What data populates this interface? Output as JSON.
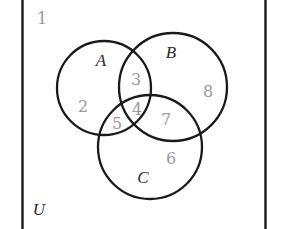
{
  "diagram": {
    "type": "venn-3-set",
    "universe": {
      "label": "U",
      "outside_region": "1"
    },
    "sets": [
      {
        "label": "A",
        "cx": 104,
        "cy": 88,
        "r": 47
      },
      {
        "label": "B",
        "cx": 173,
        "cy": 87,
        "r": 54
      },
      {
        "label": "C",
        "cx": 150,
        "cy": 147,
        "r": 52
      }
    ],
    "regions": [
      {
        "id": "1",
        "label": "1",
        "membership": "outside all sets",
        "x": 42,
        "y": 24
      },
      {
        "id": "2",
        "label": "2",
        "membership": "A only",
        "x": 83,
        "y": 112
      },
      {
        "id": "3",
        "label": "3",
        "membership": "A and B only",
        "x": 136,
        "y": 85
      },
      {
        "id": "4",
        "label": "4",
        "membership": "A and B and C",
        "x": 137,
        "y": 115
      },
      {
        "id": "5",
        "label": "5",
        "membership": "A and C only",
        "x": 117,
        "y": 129
      },
      {
        "id": "6",
        "label": "6",
        "membership": "C only",
        "x": 171,
        "y": 164
      },
      {
        "id": "7",
        "label": "7",
        "membership": "B and C only",
        "x": 166,
        "y": 125
      },
      {
        "id": "8",
        "label": "8",
        "membership": "B only",
        "x": 208,
        "y": 97
      }
    ],
    "set_label_positions": {
      "A": {
        "x": 101,
        "y": 66
      },
      "B": {
        "x": 171,
        "y": 58
      },
      "C": {
        "x": 143,
        "y": 183
      },
      "U": {
        "x": 39,
        "y": 215
      }
    },
    "colors": {
      "stroke": "#1a1a1a",
      "region_number": "#9a9a9a",
      "set_label": "#2a2a2a",
      "background": "#ffffff"
    }
  }
}
